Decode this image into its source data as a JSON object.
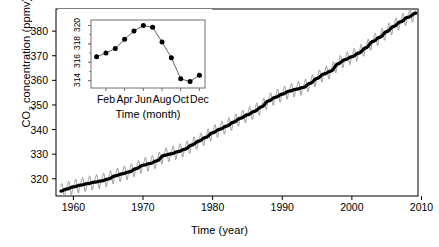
{
  "chart_data": {
    "type": "line",
    "title": "",
    "xlabel": "Time  (year)",
    "ylabel": "CO2 concentration (ppmv)",
    "ylabel_parts": {
      "pre": "CO",
      "sub": "2",
      "post": " concentration (ppmv)"
    },
    "xlim": [
      1957.5,
      2009.5
    ],
    "ylim": [
      313.0,
      389.0
    ],
    "xticks": [
      1960,
      1970,
      1980,
      1990,
      2000,
      2010
    ],
    "yticks": [
      320,
      330,
      340,
      350,
      360,
      370,
      380
    ],
    "grid": false,
    "legend": "none",
    "series": [
      {
        "name": "monthly mean CO2 (seasonal)",
        "color": "#8a8a8a",
        "linewidth": 0.9,
        "description": "monthly Mauna Loa record showing sawtooth annual cycle"
      },
      {
        "name": "smoothed trend",
        "color": "#000000",
        "linewidth": 3.2,
        "description": "thick black smoothed long-term trend line"
      }
    ],
    "trend_points": [
      {
        "x": 1958.2,
        "y": 315.0
      },
      {
        "x": 1959.0,
        "y": 315.8
      },
      {
        "x": 1960.0,
        "y": 316.7
      },
      {
        "x": 1961.0,
        "y": 317.4
      },
      {
        "x": 1962.0,
        "y": 318.0
      },
      {
        "x": 1963.0,
        "y": 318.6
      },
      {
        "x": 1964.0,
        "y": 319.1
      },
      {
        "x": 1965.0,
        "y": 319.9
      },
      {
        "x": 1966.0,
        "y": 321.2
      },
      {
        "x": 1967.0,
        "y": 322.0
      },
      {
        "x": 1968.0,
        "y": 322.8
      },
      {
        "x": 1969.0,
        "y": 324.1
      },
      {
        "x": 1970.0,
        "y": 325.5
      },
      {
        "x": 1971.0,
        "y": 326.2
      },
      {
        "x": 1972.0,
        "y": 327.3
      },
      {
        "x": 1973.0,
        "y": 329.5
      },
      {
        "x": 1974.0,
        "y": 330.1
      },
      {
        "x": 1975.0,
        "y": 331.0
      },
      {
        "x": 1976.0,
        "y": 332.0
      },
      {
        "x": 1977.0,
        "y": 333.7
      },
      {
        "x": 1978.0,
        "y": 335.3
      },
      {
        "x": 1979.0,
        "y": 336.8
      },
      {
        "x": 1980.0,
        "y": 338.7
      },
      {
        "x": 1981.0,
        "y": 340.1
      },
      {
        "x": 1982.0,
        "y": 341.4
      },
      {
        "x": 1983.0,
        "y": 343.0
      },
      {
        "x": 1984.0,
        "y": 344.6
      },
      {
        "x": 1985.0,
        "y": 346.0
      },
      {
        "x": 1986.0,
        "y": 347.4
      },
      {
        "x": 1987.0,
        "y": 349.2
      },
      {
        "x": 1988.0,
        "y": 351.6
      },
      {
        "x": 1989.0,
        "y": 353.1
      },
      {
        "x": 1990.0,
        "y": 354.4
      },
      {
        "x": 1991.0,
        "y": 355.6
      },
      {
        "x": 1992.0,
        "y": 356.4
      },
      {
        "x": 1993.0,
        "y": 357.1
      },
      {
        "x": 1994.0,
        "y": 358.8
      },
      {
        "x": 1995.0,
        "y": 360.8
      },
      {
        "x": 1996.0,
        "y": 362.6
      },
      {
        "x": 1997.0,
        "y": 363.8
      },
      {
        "x": 1998.0,
        "y": 366.7
      },
      {
        "x": 1999.0,
        "y": 368.4
      },
      {
        "x": 2000.0,
        "y": 369.6
      },
      {
        "x": 2001.0,
        "y": 371.1
      },
      {
        "x": 2002.0,
        "y": 373.2
      },
      {
        "x": 2003.0,
        "y": 375.8
      },
      {
        "x": 2004.0,
        "y": 377.5
      },
      {
        "x": 2005.0,
        "y": 379.8
      },
      {
        "x": 2006.0,
        "y": 381.9
      },
      {
        "x": 2007.0,
        "y": 383.8
      },
      {
        "x": 2008.0,
        "y": 385.6
      },
      {
        "x": 2009.2,
        "y": 387.3
      }
    ],
    "seasonal_amplitude": 3.1,
    "seasonal_shape_by_month": [
      0.3,
      0.85,
      1.5,
      2.55,
      3.05,
      2.35,
      0.8,
      -1.35,
      -2.95,
      -2.95,
      -1.6,
      -0.45
    ],
    "inset": {
      "type": "line",
      "title": "",
      "xlabel": "Time  (month)",
      "ylabel": "",
      "xlim": [
        0.4,
        12.6
      ],
      "ylim": [
        313.2,
        320.6
      ],
      "yticks": [
        314,
        316,
        318,
        320
      ],
      "xticks": [
        2,
        4,
        6,
        8,
        10,
        12
      ],
      "xticklabels": [
        "Feb",
        "Apr",
        "Jun",
        "Aug",
        "Oct",
        "Dec"
      ],
      "marker": "filled-circle",
      "marker_color": "#000000",
      "line_color": "#555555",
      "categories": [
        "Jan",
        "Feb",
        "Mar",
        "Apr",
        "May",
        "Jun",
        "Jul",
        "Aug",
        "Sep",
        "Oct",
        "Nov",
        "Dec"
      ],
      "values": [
        316.6,
        317.0,
        317.5,
        318.5,
        319.4,
        320.0,
        319.8,
        318.2,
        316.5,
        314.2,
        313.9,
        314.6
      ]
    }
  },
  "axes": {
    "main": {
      "xtick_labels": [
        "1960",
        "1970",
        "1980",
        "1990",
        "2000",
        "2010"
      ],
      "ytick_labels": [
        "320",
        "330",
        "340",
        "350",
        "360",
        "370",
        "380"
      ],
      "xlabel": "Time  (year)"
    },
    "inset": {
      "xtick_labels": [
        "Feb",
        "Apr",
        "Jun",
        "Aug",
        "Oct",
        "Dec"
      ],
      "ytick_labels": [
        "314",
        "316",
        "318",
        "320"
      ],
      "xlabel": "Time  (month)"
    }
  },
  "colors": {
    "seasonal": "#8a8a8a",
    "trend": "#000000",
    "frame": "#000000",
    "inset_frame": "#6f6f6f",
    "background": "#ffffff"
  }
}
